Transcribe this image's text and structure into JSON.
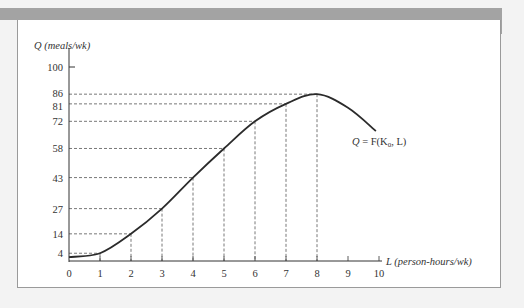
{
  "chart_data": {
    "type": "line",
    "title": "",
    "xlabel": "L (person-hours/wk)",
    "ylabel": "Q (meals/wk)",
    "x_ticks": [
      "0",
      "1",
      "2",
      "3",
      "4",
      "5",
      "6",
      "7",
      "8",
      "9",
      "10"
    ],
    "y_ticks": [
      "4",
      "14",
      "27",
      "43",
      "58",
      "72",
      "81",
      "86",
      "100"
    ],
    "xlim": [
      0,
      10
    ],
    "ylim": [
      0,
      100
    ],
    "grid": false,
    "dashed_guides": true,
    "series": [
      {
        "name": "Q = F(K0, L)",
        "x": [
          0,
          1,
          2,
          3,
          4,
          5,
          6,
          7,
          8,
          9,
          9.9
        ],
        "values": [
          2,
          4,
          14,
          27,
          43,
          58,
          72,
          81,
          86,
          79,
          67
        ]
      }
    ],
    "annotations": [
      {
        "text": "Q = F(K0, L)",
        "position": "right of curve end"
      }
    ],
    "legend": "none"
  },
  "labels": {
    "y_axis_title": "Q (meals/wk)",
    "x_axis_title": "L (person-hours/wk)",
    "func_q": "Q",
    "func_eq": " = F(K",
    "func_sub": "0",
    "func_rest": ", L)",
    "origin": "0",
    "y100": "100"
  },
  "colors": {
    "curve": "#2b2b2b",
    "dashes": "#555555",
    "band": "#a3a3a3",
    "background": "#f3f3f3",
    "panel": "#ffffff"
  }
}
